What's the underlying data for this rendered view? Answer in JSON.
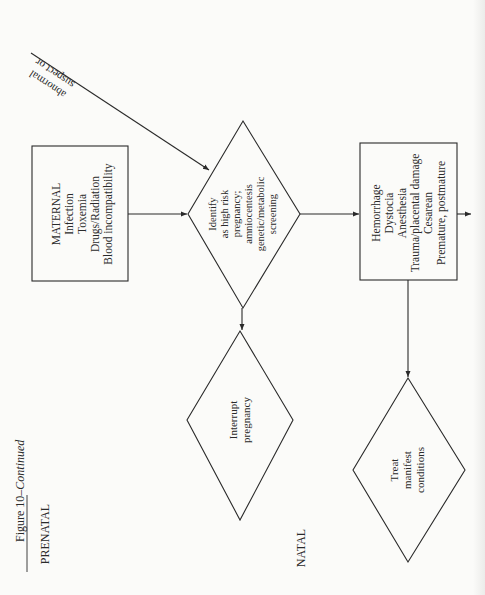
{
  "figure": {
    "caption_prefix": "Figure 10–",
    "caption_italic": "Continued",
    "section_prenatal": "PRENATAL",
    "section_natal": "NATAL"
  },
  "nodes": {
    "maternal_box": {
      "lines": [
        "MATERNAL",
        "Infection",
        "Toxemia",
        "Drugs/Radiation",
        "Blood incompatibility"
      ]
    },
    "identify_diamond": {
      "lines": [
        "Identify",
        "as high risk",
        "pregnancy;",
        "amniocentesis",
        "genetic/metabolic",
        "screening"
      ]
    },
    "interrupt_diamond": {
      "lines": [
        "Interrupt",
        "pregnancy"
      ]
    },
    "natal_box": {
      "lines": [
        "Hemorrhage",
        "Dystocia",
        "Anesthesia",
        "Trauma/placental damage",
        "Cesarean",
        "Premature, postmature"
      ]
    },
    "treat_diamond": {
      "lines": [
        "Treat",
        "manifest",
        "conditions"
      ]
    }
  },
  "edge_labels": {
    "suspect_line1": "suspect or",
    "suspect_line2": "abnormal"
  },
  "colors": {
    "ink": "#2a2a2a",
    "paper": "#fbfbf9"
  }
}
